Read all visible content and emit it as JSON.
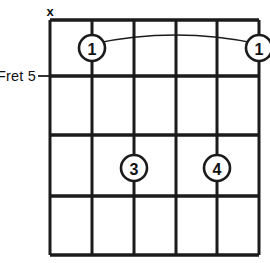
{
  "diagram": {
    "type": "guitar-chord-diagram",
    "title": "",
    "strings": 6,
    "frets": 4,
    "position_label": "Fret 5",
    "position_label_dash": "–",
    "position_fret_index": 1,
    "colors": {
      "line": "#1b1b1b",
      "background": "#ffffff",
      "text": "#111111"
    },
    "geometry": {
      "grid_left": 50,
      "grid_right": 259,
      "grid_top": 20,
      "grid_bottom": 255,
      "string_x": [
        50,
        92,
        134,
        176,
        217,
        259
      ],
      "fret_y": [
        20,
        76,
        135,
        196,
        255
      ],
      "circle_radius": 13
    },
    "open_mute_markers": [
      {
        "string_index": 0,
        "symbol": "x",
        "meaning": "muted",
        "x": 50,
        "y": 11
      }
    ],
    "fingerings": [
      {
        "finger": "1",
        "string_index": 1,
        "fret_index": 0,
        "cx": 92,
        "cy": 48
      },
      {
        "finger": "1",
        "string_index": 5,
        "fret_index": 0,
        "cx": 259,
        "cy": 48
      },
      {
        "finger": "3",
        "string_index": 2,
        "fret_index": 2,
        "cx": 134,
        "cy": 168
      },
      {
        "finger": "4",
        "string_index": 4,
        "fret_index": 2,
        "cx": 217,
        "cy": 168
      }
    ],
    "barre": {
      "finger": "1",
      "from_x": 92,
      "to_x": 259,
      "y": 48,
      "peak_y": 32
    }
  }
}
